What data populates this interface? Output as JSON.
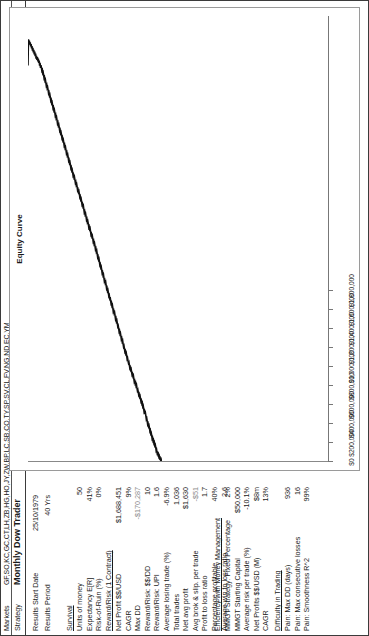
{
  "header": {
    "markets_label": "Markets",
    "markets_value": "GF,SO,KC,GC,CT,LH,ZB,HG,HO,JY,ZW,BP,LC,SB,CO,TY,SP,SV,CL,FV,NG,ND,EC,YM",
    "strategy_label": "Strategy",
    "strategy_value": "Monthly Dow Trader"
  },
  "meta": {
    "start_label": "Results Start Date",
    "start_value": "25/10/1979",
    "period_label": "Results Period",
    "period_value": "40 Yrs"
  },
  "groups": [
    {
      "title": "Survival",
      "rows": [
        {
          "label": "Units of money",
          "value": "50"
        },
        {
          "label": "Expectancy E[R]",
          "value": "41%"
        },
        {
          "label": "Risk-of-Ruin (%)",
          "value": "0%"
        }
      ]
    },
    {
      "title": "Reward/Risk (1 Contract)",
      "rows": [
        {
          "label": "Net Profit $$/USD",
          "value": "$1,688,451"
        },
        {
          "label": "CAGR",
          "value": "9%"
        },
        {
          "label": "Max DD",
          "value": "-$170,287",
          "negative": true
        },
        {
          "label": "Reward/Risk: $$/DD",
          "value": "10"
        },
        {
          "label": "Reward/Risk: UPI",
          "value": "1.6"
        },
        {
          "label": "Average losing trade (%)",
          "value": "-6.9%"
        },
        {
          "label": "Total trades",
          "value": "1,036"
        },
        {
          "label": "Net avg profit",
          "value": "$1,630"
        },
        {
          "label": "Avg brok & slip. per trade",
          "value": "-$51",
          "negative": true
        },
        {
          "label": "Profit to loss ratio",
          "value": "1.7"
        },
        {
          "label": "Percentage profitable",
          "value": "40%"
        },
        {
          "label": "Average win to loss ratio",
          "value": "2.6"
        }
      ]
    },
    {
      "title": "Efficiency with Money Management",
      "rows": [
        {
          "label": "MMGT Strategy: Fixed Percentage",
          "value": "2%"
        },
        {
          "label": "MMGT Starting Capital",
          "value": "$50,000"
        },
        {
          "label": "Average risk per trade (%)",
          "value": "-10.1%"
        },
        {
          "label": "Net Profits $$/USD (M)",
          "value": "$8m"
        },
        {
          "label": "CAGR",
          "value": "13%"
        }
      ]
    },
    {
      "title": "Difficulty in Trading",
      "rows": [
        {
          "label": "Pain: Max DD (days)",
          "value": "936"
        },
        {
          "label": "Pain: Max consecutive losses",
          "value": "16"
        },
        {
          "label": "Pain: Smoothness R^2",
          "value": "99%"
        }
      ]
    }
  ],
  "chart_data": {
    "type": "line",
    "title": "Equity Curve",
    "xlabel": "",
    "ylabel": "",
    "grid": false,
    "legend": "none",
    "ylim": [
      0,
      1900000
    ],
    "yticks": [
      0,
      200000,
      400000,
      600000,
      800000,
      1000000,
      1200000,
      1400000,
      1600000,
      1800000
    ],
    "ytick_labels": [
      "$0",
      "$200,000",
      "$400,000",
      "$600,000",
      "$800,000",
      "$1,000,000",
      "$1,200,000",
      "$1,400,000",
      "$1,600,000",
      "$1,800,000"
    ],
    "series": [
      {
        "name": "Equity",
        "values": [
          0,
          9000,
          6000,
          14000,
          11000,
          22000,
          18000,
          30000,
          27000,
          41000,
          36000,
          48000,
          44000,
          59000,
          70000,
          66000,
          80000,
          76000,
          90000,
          86000,
          99000,
          95000,
          110000,
          120000,
          116000,
          131000,
          127000,
          141000,
          152000,
          148000,
          160000,
          156000,
          170000,
          182000,
          178000,
          193000,
          205000,
          200000,
          214000,
          210000,
          225000,
          236000,
          232000,
          248000,
          244000,
          258000,
          254000,
          266000,
          278000,
          274000,
          286000,
          282000,
          294000,
          305000,
          301000,
          312000,
          325000,
          321000,
          334000,
          330000,
          342000,
          338000,
          352000,
          365000,
          361000,
          372000,
          368000,
          381000,
          393000,
          389000,
          400000,
          396000,
          410000,
          422000,
          418000,
          428000,
          440000,
          436000,
          450000,
          462000,
          458000,
          470000,
          466000,
          480000,
          492000,
          488000,
          500000,
          514000,
          510000,
          524000,
          520000,
          534000,
          546000,
          542000,
          556000,
          552000,
          566000,
          578000,
          574000,
          588000,
          600000,
          596000,
          610000,
          606000,
          620000,
          634000,
          630000,
          642000,
          638000,
          654000,
          666000,
          662000,
          676000,
          672000,
          686000,
          700000,
          695000,
          708000,
          704000,
          718000,
          730000,
          726000,
          740000,
          736000,
          750000,
          764000,
          760000,
          772000,
          768000,
          782000,
          796000,
          792000,
          806000,
          802000,
          816000,
          830000,
          826000,
          840000,
          836000,
          850000,
          864000,
          860000,
          874000,
          870000,
          884000,
          898000,
          894000,
          908000,
          904000,
          918000,
          930000,
          926000,
          940000,
          936000,
          950000,
          962000,
          958000,
          970000,
          966000,
          980000,
          994000,
          990000,
          1002000,
          998000,
          1012000,
          1024000,
          1020000,
          1034000,
          1030000,
          1044000,
          1056000,
          1052000,
          1066000,
          1062000,
          1076000,
          1090000,
          1086000,
          1098000,
          1094000,
          1108000,
          1120000,
          1116000,
          1130000,
          1126000,
          1140000,
          1152000,
          1148000,
          1160000,
          1156000,
          1170000,
          1182000,
          1178000,
          1192000,
          1188000,
          1200000,
          1214000,
          1210000,
          1222000,
          1218000,
          1232000,
          1244000,
          1240000,
          1254000,
          1250000,
          1264000,
          1276000,
          1272000,
          1286000,
          1282000,
          1296000,
          1308000,
          1304000,
          1318000,
          1314000,
          1328000,
          1340000,
          1336000,
          1350000,
          1346000,
          1360000,
          1372000,
          1368000,
          1382000,
          1378000,
          1392000,
          1404000,
          1400000,
          1414000,
          1410000,
          1424000,
          1436000,
          1432000,
          1446000,
          1442000,
          1456000,
          1468000,
          1464000,
          1478000,
          1474000,
          1488000,
          1500000,
          1496000,
          1510000,
          1506000,
          1520000,
          1532000,
          1528000,
          1542000,
          1538000,
          1552000,
          1564000,
          1560000,
          1574000,
          1570000,
          1584000,
          1596000,
          1592000,
          1606000,
          1602000,
          1616000,
          1628000,
          1624000,
          1638000,
          1634000,
          1648000,
          1660000,
          1656000,
          1670000,
          1666000,
          1680000,
          1690000,
          1678000,
          1700000,
          1688000,
          1710000,
          1700000,
          1718000,
          1706000,
          1724000,
          1712000,
          1730000,
          1718000,
          1740000,
          1728000,
          1748000,
          1736000,
          1756000,
          1744000,
          1764000,
          1752000,
          1772000,
          1762000,
          1780000,
          1770000,
          1788000,
          1778000,
          1795000,
          1786000,
          1800000,
          1688451
        ]
      }
    ]
  }
}
